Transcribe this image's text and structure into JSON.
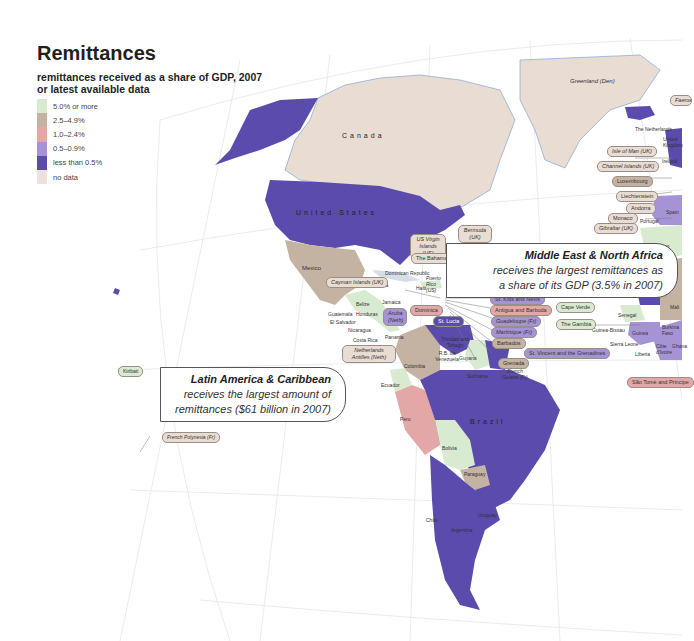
{
  "title": "Remittances",
  "subtitle": "remittances received as a share of GDP, 2007 or latest available data",
  "legend": [
    {
      "label": "5.0% or more",
      "color": "#d8ead0"
    },
    {
      "label": "2.5–4.9%",
      "color": "#c4b2a2"
    },
    {
      "label": "1.0–2.4%",
      "color": "#e2a7a6"
    },
    {
      "label": "0.5–0.9%",
      "color": "#a593d5"
    },
    {
      "label": "less than 0.5%",
      "color": "#5a4bad"
    },
    {
      "label": "no data",
      "color": "#f0e0dc"
    }
  ],
  "callouts": {
    "mena": {
      "heading": "Middle East & North Africa",
      "line1": "receives the largest remittances as",
      "line2": "a share of its GDP (3.5% in 2007)"
    },
    "lac": {
      "heading": "Latin America & Caribbean",
      "line1": "receives the largest amount of",
      "line2": "remittances ($61 billion in 2007)"
    }
  },
  "countries": {
    "canada": "Canada",
    "united_states": "United States",
    "brazil": "Brazil",
    "greenland": "Greenland (Den)",
    "mexico": "Mexico",
    "cuba": "Cuba",
    "dominican_republic": "Dominican Republic",
    "puerto_rico": "Puerto Rico (US)",
    "haiti": "Haiti",
    "jamaica": "Jamaica",
    "belize": "Belize",
    "guatemala": "Guatemala",
    "honduras": "Honduras",
    "el_salvador": "El Salvador",
    "nicaragua": "Nicaragua",
    "costa_rica": "Costa Rica",
    "panama": "Panama",
    "colombia": "Colombia",
    "venezuela": "R.B. de Venezuela",
    "trinidad": "Trinidad and Tobago",
    "guyana": "Guyana",
    "suriname": "Suriname",
    "french_guiana": "French Guiana (Fr)",
    "ecuador": "Ecuador",
    "peru": "Peru",
    "bolivia": "Bolivia",
    "paraguay": "Paraguay",
    "uruguay": "Uruguay",
    "chile": "Chile",
    "argentina": "Argentina",
    "netherlands": "The Netherlands",
    "united_kingdom": "United Kingdom",
    "ireland": "Ireland",
    "portugal": "Portugal",
    "spain": "Spain",
    "morocco": "Morocco",
    "former_spanish_sahara": "Former Spanish Sahara",
    "mauritania": "Mauritania",
    "mali": "Mali",
    "senegal": "Senegal",
    "guinea_bissau": "Guinea-Bissau",
    "guinea": "Guinea",
    "sierra_leone": "Sierra Leone",
    "liberia": "Liberia",
    "burkina_faso": "Burkina Faso",
    "cote_divoire": "Côte d'Ivoire",
    "ghana": "Ghana"
  },
  "pills": {
    "faeroe": "Faeroe Islands (Den)",
    "isle_of_man": "Isle of Man (UK)",
    "channel_islands": "Channel Islands (UK)",
    "luxembourg": "Luxembourg",
    "liechtenstein": "Liechtenstein",
    "andorra": "Andorra",
    "monaco": "Monaco",
    "gibraltar": "Gibraltar (UK)",
    "bermuda": "Bermuda (UK)",
    "us_virgin": "US Virgin Islands (US)",
    "bahamas": "The Bahamas",
    "cayman": "Cayman Islands (UK)",
    "aruba": "Aruba (Neth)",
    "dominica": "Dominica",
    "st_lucia": "St. Lucia",
    "neth_antilles": "Netherlands Antilles (Neth)",
    "st_kitts": "St. Kitts and Nevis",
    "antigua": "Antigua and Barbuda",
    "guadeloupe": "Guadeloupe (Fr)",
    "martinique": "Martinique (Fr)",
    "barbados": "Barbados",
    "st_vincent": "St. Vincent and the Grenadines",
    "grenada": "Grenada",
    "cape_verde": "Cape Verde",
    "gambia": "The Gambia",
    "sao_tome": "São Tomé and Principe",
    "kiribati": "Kiribati",
    "french_polynesia": "French Polynesia (Fr)"
  }
}
